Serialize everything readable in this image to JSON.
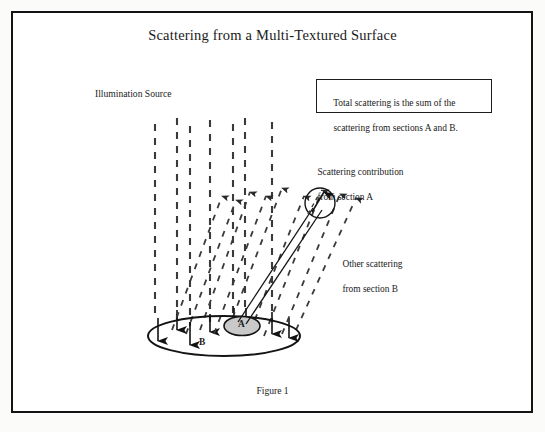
{
  "figure": {
    "title": "Scattering from a Multi-Textured Surface",
    "caption": "Figure 1",
    "illumination_label": "Illumination Source",
    "info_box": {
      "line1": "Total scattering is the sum of the",
      "line2": "scattering from sections A and B."
    },
    "annotations": {
      "contribution_a_line1": "Scattering contribution",
      "contribution_a_line2": "from section A",
      "other_b_line1": "Other scattering",
      "other_b_line2": "from section B"
    },
    "surface": {
      "section_a_label": "A",
      "section_b_label": "B"
    },
    "colors": {
      "frame": "#141414",
      "ink": "#1a1a1a",
      "ray_dash": "#3a3a3a",
      "section_a_fill": "#c9c9c9",
      "page": "#ffffff"
    },
    "geometry": {
      "illumination_ray_x": [
        155,
        177,
        190,
        210,
        233,
        245,
        272
      ],
      "illumination_ray_top": 118,
      "surface_ellipse": {
        "cx": 224,
        "cy": 336,
        "rx": 76,
        "ry": 20
      },
      "section_a_ellipse": {
        "cx": 242,
        "cy": 326,
        "rx": 18,
        "ry": 9
      },
      "detector_circle": {
        "cx": 320,
        "cy": 203,
        "r": 15
      }
    }
  }
}
